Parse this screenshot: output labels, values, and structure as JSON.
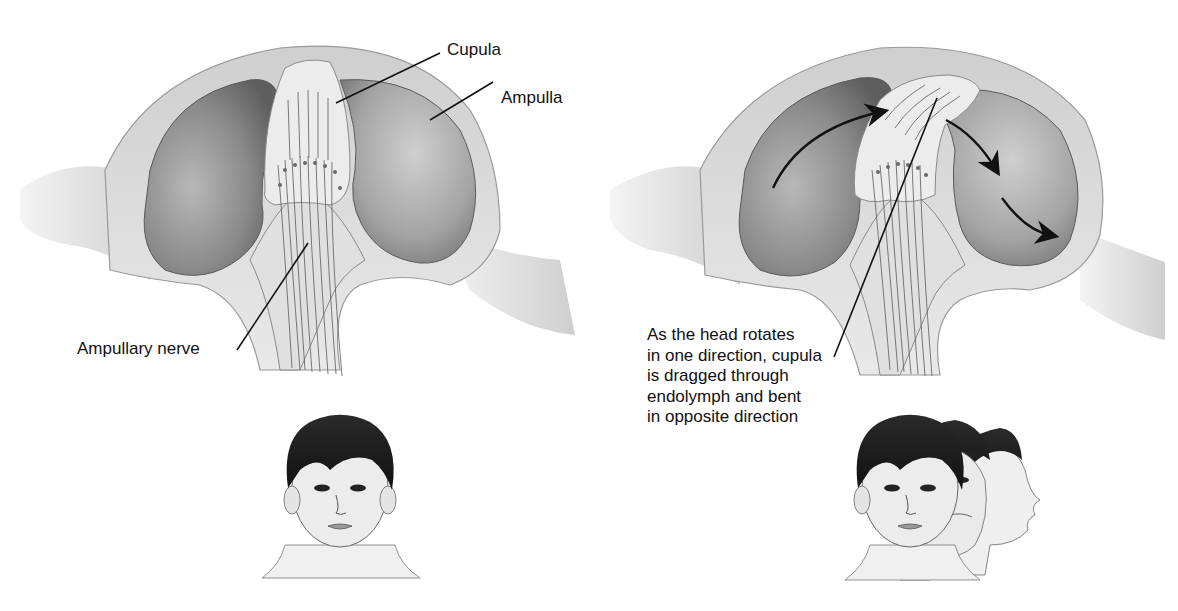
{
  "figure": {
    "type": "anatomical-diagram",
    "colors": {
      "background": "#ffffff",
      "wall": "#dcdcdc",
      "cavity_dark": "#6a6a6a",
      "cavity_light": "#bdbdbd",
      "cupula": "#e6e6e6",
      "nerve": "#555555",
      "leader_line": "#111111",
      "arrow": "#111111",
      "hair": "#1c1c1c",
      "skin": "#ececec"
    }
  },
  "panels": [
    {
      "id": "rest",
      "labels": {
        "cupula": "Cupula",
        "ampulla": "Ampulla",
        "nerve": "Ampullary nerve"
      },
      "head": "frontal view, head still"
    },
    {
      "id": "rotation",
      "caption_lines": [
        "As the head rotates",
        "in one direction, cupula",
        "is dragged through",
        "endolymph and bent",
        "in opposite direction"
      ],
      "arrows": 3,
      "head": "head rotating from frontal to profile view"
    }
  ]
}
